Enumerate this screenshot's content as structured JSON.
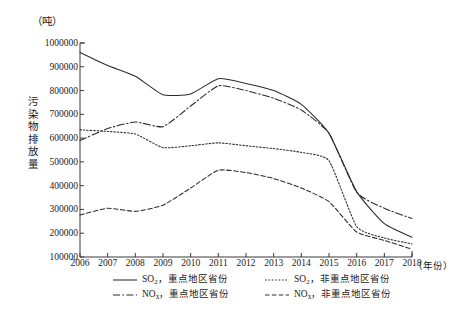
{
  "chart_data": {
    "type": "line",
    "title": "",
    "unit_label": "（吨）",
    "ylabel": "污染物排放量",
    "xlabel": "（年份）",
    "grid": false,
    "legend_position": "bottom",
    "x": [
      2006,
      2007,
      2008,
      2009,
      2010,
      2011,
      2012,
      2013,
      2014,
      2015,
      2016,
      2017,
      2018
    ],
    "categories": [
      "2006",
      "2007",
      "2008",
      "2009",
      "2010",
      "2011",
      "2012",
      "2013",
      "2014",
      "2015",
      "2016",
      "2017",
      "2018"
    ],
    "xlim": [
      2006,
      2018
    ],
    "ylim": [
      100000,
      1000000
    ],
    "yticks": [
      100000,
      200000,
      300000,
      400000,
      500000,
      600000,
      700000,
      800000,
      900000,
      1000000
    ],
    "ytick_labels": [
      "100000",
      "200000",
      "300000",
      "400000",
      "500000",
      "600000",
      "700000",
      "800000",
      "900000",
      "1000000"
    ],
    "series": [
      {
        "name": "SO₂，重点地区省份",
        "label_main": "SO",
        "label_sub": "2",
        "label_rest": "，重点地区省份",
        "style": "solid",
        "color": "#2b2b2b",
        "values": [
          960000,
          905000,
          860000,
          782000,
          786000,
          850000,
          830000,
          800000,
          742000,
          620000,
          375000,
          240000,
          183000
        ]
      },
      {
        "name": "SO₂，非重点地区省份",
        "label_main": "SO",
        "label_sub": "2",
        "label_rest": "，非重点地区省份",
        "style": "dotted",
        "color": "#2b2b2b",
        "values": [
          635000,
          628000,
          617000,
          560000,
          568000,
          580000,
          568000,
          556000,
          540000,
          505000,
          228000,
          180000,
          155000
        ]
      },
      {
        "name": "NOx，重点地区省份",
        "label_main": "NO",
        "label_sub": "x",
        "label_rest": "，重点地区省份",
        "style": "dashdot",
        "color": "#2b2b2b",
        "values": [
          590000,
          640000,
          668000,
          648000,
          735000,
          820000,
          800000,
          768000,
          718000,
          620000,
          372000,
          305000,
          262000
        ]
      },
      {
        "name": "NOx，非重点地区省份",
        "label_main": "NO",
        "label_sub": "x",
        "label_rest": "，非重点地区省份",
        "style": "dashed",
        "color": "#2b2b2b",
        "values": [
          277000,
          305000,
          292000,
          318000,
          390000,
          465000,
          455000,
          430000,
          390000,
          333000,
          205000,
          170000,
          133000
        ]
      }
    ]
  },
  "legend": {
    "rows": [
      [
        "SO₂，重点地区省份",
        "SO₂，非重点地区省份"
      ],
      [
        "NOx，重点地区省份",
        "NOx，非重点地区省份"
      ]
    ]
  }
}
